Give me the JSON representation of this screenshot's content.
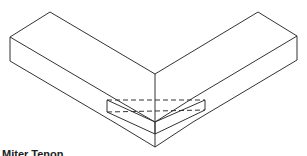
{
  "figure": {
    "stroke_color": "#333333",
    "background": "#ffffff",
    "parts": [
      {
        "name": "left-board",
        "description": "rectangular board angled to the left"
      },
      {
        "name": "right-board",
        "description": "rectangular board angled to the right"
      },
      {
        "name": "hidden-tenon",
        "description": "dashed outline of the hidden tenon"
      }
    ]
  },
  "caption": {
    "text": "Miter Tenon"
  }
}
